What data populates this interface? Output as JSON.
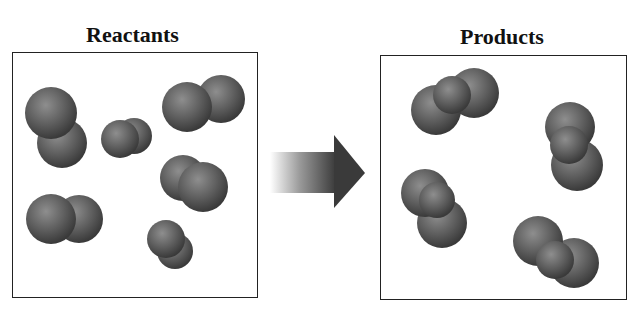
{
  "diagram": {
    "left_panel": {
      "title": "Reactants",
      "molecule_count": 6
    },
    "right_panel": {
      "title": "Products",
      "molecule_count": 4
    },
    "arrow": {
      "direction": "right",
      "meaning": "reaction"
    },
    "colors": {
      "atom": "#555555",
      "atom_highlight": "#8a8a8a",
      "border": "#222222",
      "arrow": "#3a3a3a"
    }
  }
}
